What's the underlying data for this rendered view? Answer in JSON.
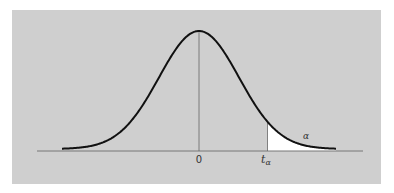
{
  "figure": {
    "colors": {
      "background": "#ffffff",
      "panel": "#cfcfcf",
      "curve": "#111111",
      "axis": "#777777",
      "tail_fill": "#ffffff"
    },
    "labels": {
      "zero": "0",
      "t_main": "t",
      "t_sub": "α",
      "alpha": "α"
    }
  },
  "chart_data": {
    "type": "area",
    "title": "",
    "xlabel": "",
    "ylabel": "",
    "x_ticks": [
      "0",
      "t_α"
    ],
    "annotations": [
      {
        "text": "α",
        "position": "upper tail region, right of t_α"
      }
    ],
    "critical_value": "t_α",
    "tail_area_label": "α",
    "center": 0,
    "grid": false,
    "legend": false
  }
}
